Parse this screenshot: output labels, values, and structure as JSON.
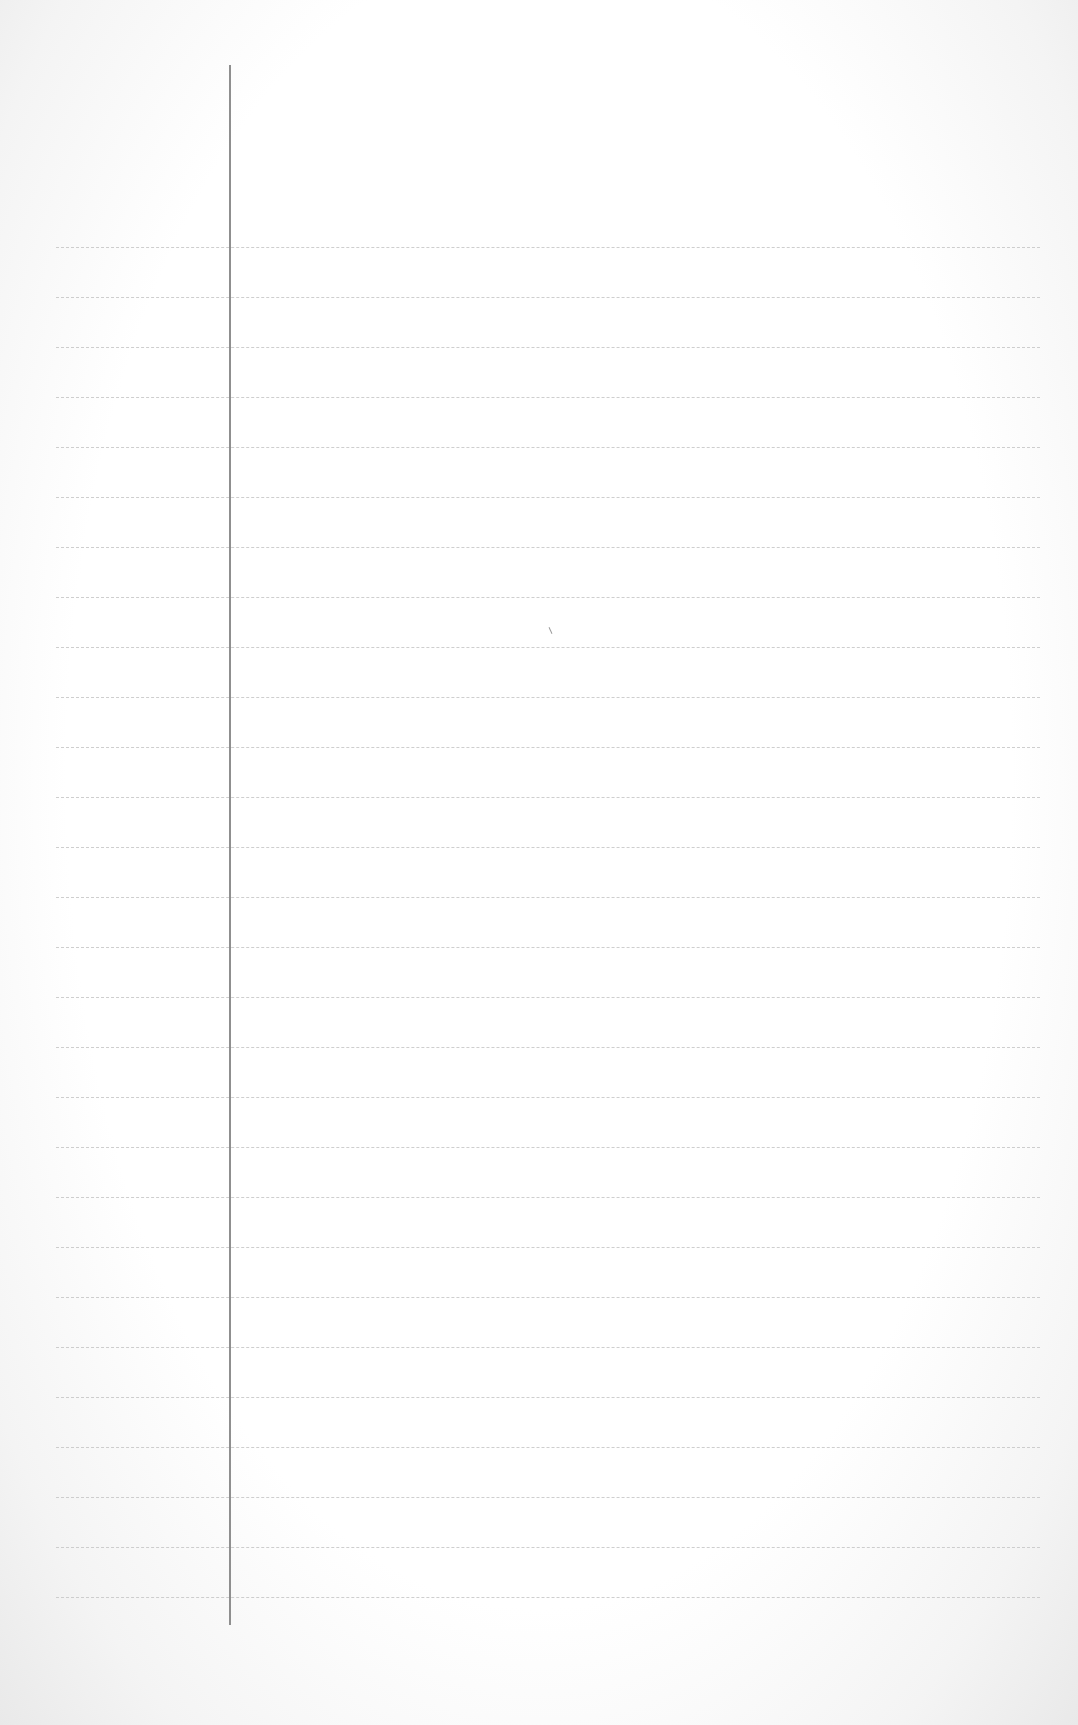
{
  "page": {
    "type": "lined-paper",
    "width": 1078,
    "height": 1725,
    "background_color": "#ffffff",
    "edge_shade_color": "#e9e9e9"
  },
  "margin_line": {
    "x": 229,
    "top": 65,
    "bottom": 1625,
    "color": "#8f8f8f"
  },
  "ruled_lines": {
    "count": 28,
    "first_y": 247,
    "spacing": 50,
    "left": 56,
    "right": 1040,
    "color": "#c9c9c9"
  },
  "content": {
    "text": ""
  }
}
